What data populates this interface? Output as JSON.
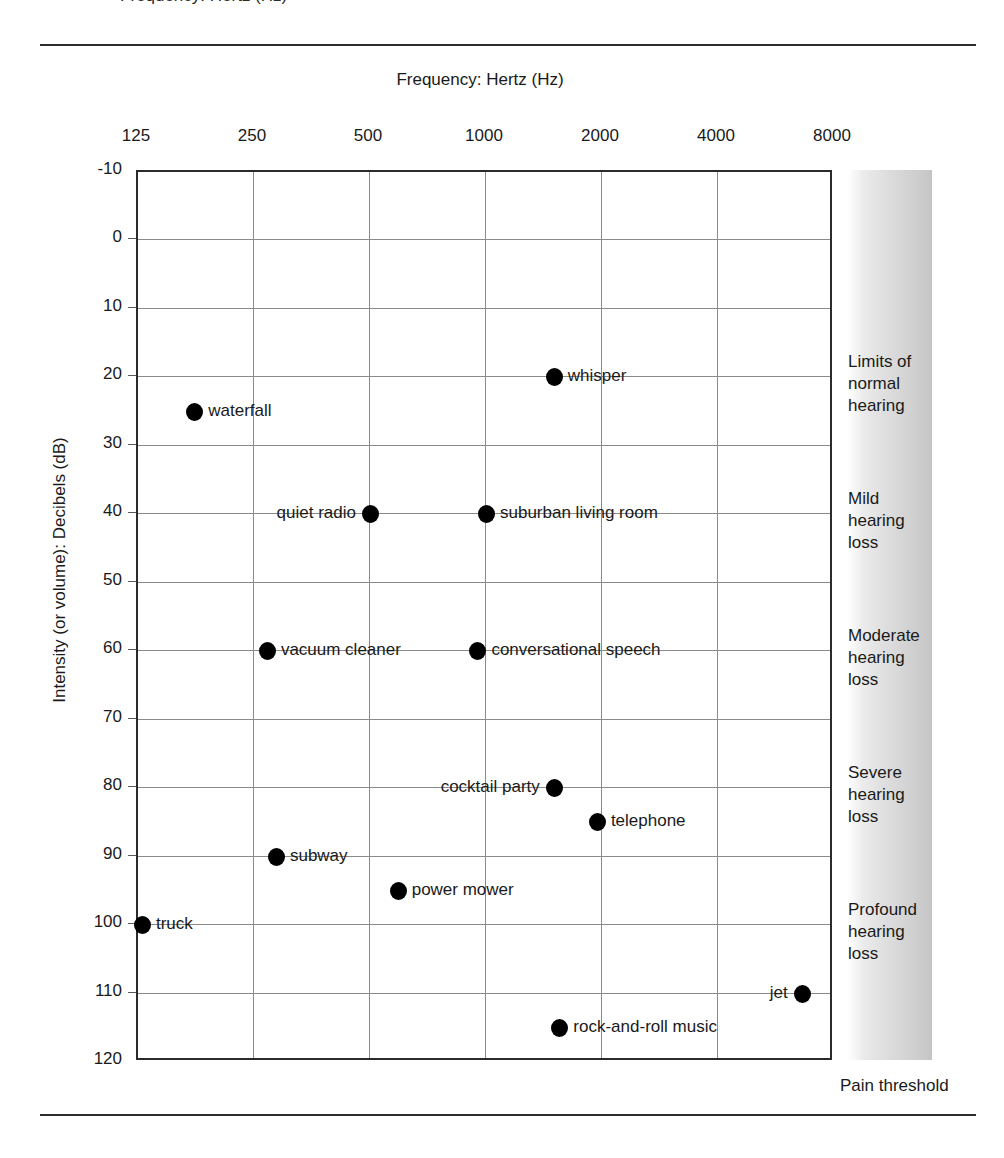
{
  "figure": {
    "top_caption_clipped": "Frequency: Hertz (Hz)",
    "pain_threshold_label": "Pain threshold"
  },
  "chart_data": {
    "type": "scatter",
    "title": "",
    "xlabel": "Frequency: Hertz (Hz)",
    "ylabel": "Intensity (or volume): Decibels (dB)",
    "xscale": "log",
    "xlim": [
      125,
      8000
    ],
    "ylim": [
      -10,
      120
    ],
    "y_inverted": true,
    "grid": true,
    "legend": "none",
    "xticks": [
      "125",
      "250",
      "500",
      "1000",
      "2000",
      "4000",
      "8000"
    ],
    "xtick_values": [
      125,
      250,
      500,
      1000,
      2000,
      4000,
      8000
    ],
    "yticks": [
      "-10",
      "0",
      "10",
      "20",
      "30",
      "40",
      "50",
      "60",
      "70",
      "80",
      "90",
      "100",
      "110",
      "120"
    ],
    "ytick_values": [
      -10,
      0,
      10,
      20,
      30,
      40,
      50,
      60,
      70,
      80,
      90,
      100,
      110,
      120
    ],
    "points": [
      {
        "label": "whisper",
        "x": 1500,
        "y": 20,
        "label_side": "right"
      },
      {
        "label": "waterfall",
        "x": 175,
        "y": 25,
        "label_side": "right"
      },
      {
        "label": "quiet radio",
        "x": 500,
        "y": 40,
        "label_side": "left"
      },
      {
        "label": "suburban living room",
        "x": 1000,
        "y": 40,
        "label_side": "right"
      },
      {
        "label": "vacuum cleaner",
        "x": 270,
        "y": 60,
        "label_side": "right"
      },
      {
        "label": "conversational speech",
        "x": 950,
        "y": 60,
        "label_side": "right"
      },
      {
        "label": "cocktail party",
        "x": 1500,
        "y": 80,
        "label_side": "left"
      },
      {
        "label": "telephone",
        "x": 1940,
        "y": 85,
        "label_side": "right"
      },
      {
        "label": "subway",
        "x": 285,
        "y": 90,
        "label_side": "right"
      },
      {
        "label": "power mower",
        "x": 590,
        "y": 95,
        "label_side": "right"
      },
      {
        "label": "truck",
        "x": 128,
        "y": 100,
        "label_side": "right"
      },
      {
        "label": "jet",
        "x": 6600,
        "y": 110,
        "label_side": "left"
      },
      {
        "label": "rock-and-roll music",
        "x": 1550,
        "y": 115,
        "label_side": "right"
      }
    ],
    "annotations": [
      {
        "name": "limits-of-normal-hearing",
        "lines": [
          "Limits of",
          "normal",
          "hearing"
        ],
        "y_top": 20
      },
      {
        "name": "mild-hearing-loss",
        "lines": [
          "Mild",
          "hearing",
          "loss"
        ],
        "y_top": 40
      },
      {
        "name": "moderate-hearing-loss",
        "lines": [
          "Moderate",
          "hearing",
          "loss"
        ],
        "y_top": 60
      },
      {
        "name": "severe-hearing-loss",
        "lines": [
          "Severe",
          "hearing",
          "loss"
        ],
        "y_top": 80
      },
      {
        "name": "profound-hearing-loss",
        "lines": [
          "Profound",
          "hearing",
          "loss"
        ],
        "y_top": 100
      }
    ]
  },
  "colors": {
    "point": "#000000",
    "grid": "#8a8a8a",
    "frame": "#2b2b2b",
    "text": "#1a1a1a",
    "band_light": "#ffffff",
    "band_dark": "#c4c4c4"
  }
}
